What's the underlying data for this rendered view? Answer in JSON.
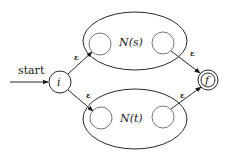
{
  "diagram": {
    "type": "nfa-union-construction",
    "start_label": "start",
    "nodes": {
      "initial": {
        "label": "i",
        "cx": 60,
        "cy": 82,
        "r": 11
      },
      "final": {
        "label": "f",
        "cx": 208,
        "cy": 80,
        "r": 10,
        "inner_r": 7
      }
    },
    "subautomata": [
      {
        "label": "N(s)",
        "ellipse": {
          "cx": 135,
          "cy": 41,
          "rx": 52,
          "ry": 29
        },
        "start_state": {
          "cx": 100,
          "cy": 44,
          "r": 11
        },
        "end_state": {
          "cx": 163,
          "cy": 43,
          "r": 11
        }
      },
      {
        "label": "N(t)",
        "ellipse": {
          "cx": 135,
          "cy": 119,
          "rx": 52,
          "ry": 30
        },
        "start_state": {
          "cx": 101,
          "cy": 118,
          "r": 11
        },
        "end_state": {
          "cx": 163,
          "cy": 117,
          "r": 11
        }
      }
    ],
    "edges": [
      {
        "from": "start",
        "to": "i",
        "label": ""
      },
      {
        "from": "i",
        "to": "N(s).start",
        "label": "ε"
      },
      {
        "from": "i",
        "to": "N(t).start",
        "label": "ε"
      },
      {
        "from": "N(s).end",
        "to": "f",
        "label": "ε"
      },
      {
        "from": "N(t).end",
        "to": "f",
        "label": "ε"
      }
    ],
    "epsilon": "ε",
    "stroke_color": "#2a2a2a"
  }
}
